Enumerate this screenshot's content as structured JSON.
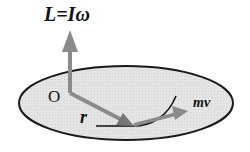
{
  "diagram": {
    "title": "L=Iω",
    "origin_label": "O",
    "radius_label": "r",
    "momentum_label": "mv",
    "colors": {
      "background": "#ffffff",
      "disk_fill": "#e3e3e3",
      "disk_stroke": "#1a1a1a",
      "vector": "#8a8a8a",
      "path": "#111111",
      "text": "#111111"
    },
    "elements": [
      {
        "id": "angular-momentum-vector",
        "label": "L=Iω",
        "direction": "up"
      },
      {
        "id": "position-vector",
        "label": "r",
        "from": "O",
        "to": "particle"
      },
      {
        "id": "momentum-vector",
        "label": "mv",
        "direction": "tangent"
      },
      {
        "id": "disk",
        "shape": "ellipse"
      },
      {
        "id": "trajectory",
        "shape": "curve"
      }
    ]
  }
}
